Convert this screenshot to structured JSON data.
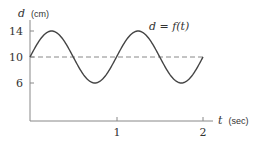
{
  "chart_data": {
    "type": "line",
    "title": "",
    "xlabel": "t (sec)",
    "ylabel": "d (cm)",
    "xlabel_var": "t",
    "xlabel_unit": "(sec)",
    "ylabel_var": "d",
    "ylabel_unit": "(cm)",
    "annotation": "d = f(t)",
    "xlim": [
      0,
      2
    ],
    "ylim": [
      0,
      14
    ],
    "x_ticks": [
      1,
      2
    ],
    "x_tick_labels": [
      "1",
      "2"
    ],
    "y_ticks": [
      6,
      10,
      14
    ],
    "y_tick_labels": [
      "6",
      "10",
      "14"
    ],
    "grid": false,
    "reference_line": {
      "y": 10,
      "style": "dashed"
    },
    "series": [
      {
        "name": "d = f(t)",
        "formula": "10 + 4 sin(2πt)",
        "x": [
          0,
          0.25,
          0.5,
          0.75,
          1.0,
          1.25,
          1.5,
          1.75,
          2.0
        ],
        "values": [
          10,
          14,
          10,
          6,
          10,
          14,
          10,
          6,
          10
        ]
      }
    ]
  },
  "colors": {
    "curve": "#444444",
    "axis": "#888888",
    "dashed": "#888888",
    "text": "#333333"
  }
}
